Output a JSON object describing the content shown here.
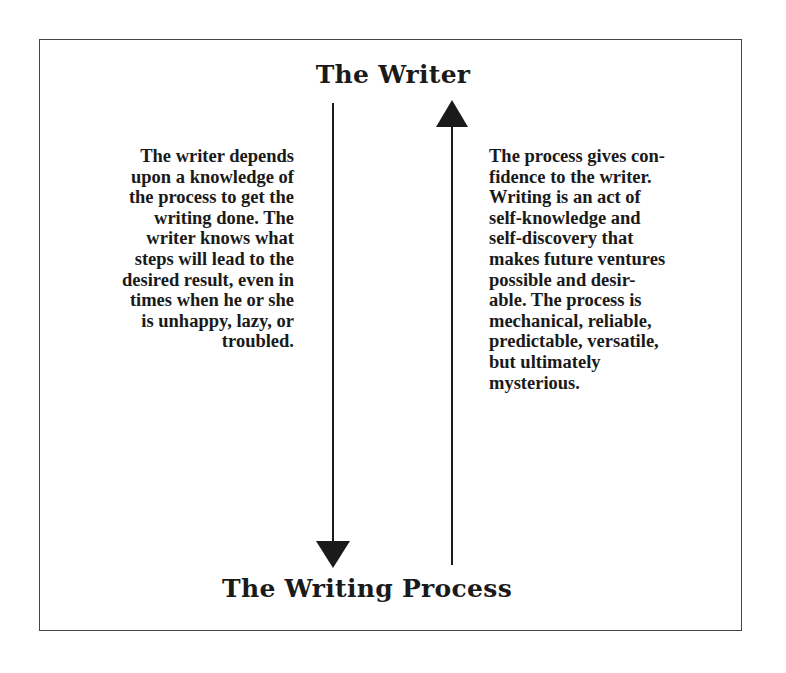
{
  "diagram": {
    "top_node": "The Writer",
    "bottom_node": "The Writing Process",
    "left_text_lines": [
      "The writer depends",
      "upon a knowledge of",
      "the process to get the",
      "writing done. The",
      "writer knows what",
      "steps will lead to the",
      "desired result, even in",
      "times when he or she",
      "is unhappy, lazy, or",
      "troubled."
    ],
    "right_text_lines": [
      "The process gives con-",
      "fidence to the writer.",
      "Writing is an act of",
      "self-knowledge and",
      "self-discovery that",
      "makes future ventures",
      "possible and desir-",
      "able. The process is",
      "mechanical, reliable,",
      "predictable, versatile,",
      "but ultimately",
      "mysterious."
    ],
    "arrows": [
      {
        "from": "The Writer",
        "to": "The Writing Process",
        "direction": "down"
      },
      {
        "from": "The Writing Process",
        "to": "The Writer",
        "direction": "up"
      }
    ]
  }
}
